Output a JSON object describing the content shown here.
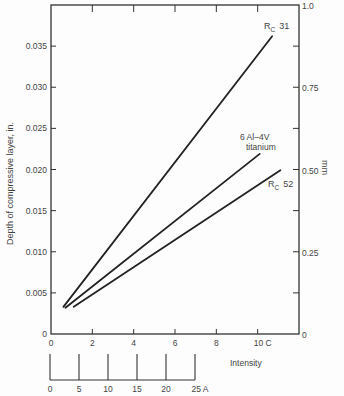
{
  "chart_data": {
    "type": "line",
    "title": "",
    "xlabel": "Intensity",
    "ylabel": "Depth of compressive layer, in.",
    "ylabel_right": "mm",
    "x_axis_C": {
      "ticks": [
        0,
        2,
        4,
        6,
        8,
        10
      ],
      "tick_labels": [
        "0",
        "2",
        "4",
        "6",
        "8",
        "10 C"
      ],
      "range": [
        0,
        12
      ]
    },
    "x_axis_A": {
      "ticks": [
        0,
        5,
        10,
        15,
        20,
        25
      ],
      "tick_labels": [
        "0",
        "5",
        "10",
        "15",
        "20",
        "25 A"
      ]
    },
    "ylim": [
      0,
      0.04
    ],
    "y_ticks": [
      0,
      0.005,
      0.01,
      0.015,
      0.02,
      0.025,
      0.03,
      0.035
    ],
    "y_tick_labels": [
      "0",
      "0.005",
      "0.010",
      "0.015",
      "0.020",
      "0.025",
      "0.030",
      "0.035"
    ],
    "y_right": {
      "range": [
        0,
        1.0
      ],
      "tick_labels": [
        "0",
        "0.25",
        "0.50",
        "0.75",
        "1.0"
      ]
    },
    "grid": false,
    "series": [
      {
        "name": "Rc 31",
        "label_main": "R",
        "label_sub": "C",
        "label_num": "31",
        "x": [
          0.6,
          10.7
        ],
        "y": [
          0.0033,
          0.0362
        ]
      },
      {
        "name": "6 Al-4V titanium",
        "label_line1": "6 Al–4V",
        "label_line2": "titanium",
        "x": [
          0.7,
          10.1
        ],
        "y": [
          0.0032,
          0.0219
        ]
      },
      {
        "name": "Rc 52",
        "label_main": "R",
        "label_sub": "C",
        "label_num": "52",
        "x": [
          1.1,
          11.1
        ],
        "y": [
          0.0033,
          0.0199
        ]
      }
    ]
  }
}
